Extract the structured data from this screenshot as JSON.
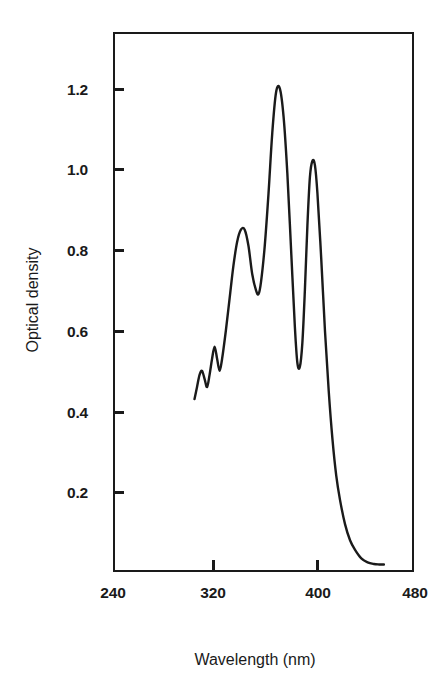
{
  "chart_data": {
    "type": "line",
    "title": "",
    "xlabel": "Wavelength (nm)",
    "ylabel": "Optical density",
    "xlim": [
      240,
      480
    ],
    "ylim": [
      0,
      1.34
    ],
    "grid": false,
    "legend": null,
    "xticks": [
      240,
      320,
      400,
      480
    ],
    "xtick_labels": [
      "240",
      "320",
      "400",
      "480"
    ],
    "yticks": [
      0.2,
      0.4,
      0.6,
      0.8,
      1.0,
      1.2
    ],
    "ytick_labels": [
      "0.2",
      "0.4",
      "0.6",
      "0.8",
      "1.0",
      "1.2"
    ],
    "line_color": "#1a1a1a",
    "line_width": 2.4,
    "series": [
      {
        "name": "absorption spectrum",
        "x": [
          305,
          307,
          309,
          311,
          313,
          315,
          317,
          319,
          321,
          323,
          325,
          327,
          330,
          333,
          336,
          339,
          342,
          345,
          348,
          351,
          354,
          356,
          358,
          361,
          364,
          367,
          370,
          373,
          376,
          379,
          382,
          385,
          387,
          389,
          391,
          393,
          395,
          397,
          399,
          401,
          403,
          406,
          409,
          412,
          415,
          418,
          421,
          425,
          429,
          433,
          438,
          443,
          448,
          452,
          456
        ],
        "y": [
          0.43,
          0.46,
          0.49,
          0.5,
          0.48,
          0.46,
          0.49,
          0.53,
          0.56,
          0.53,
          0.5,
          0.53,
          0.6,
          0.68,
          0.76,
          0.82,
          0.85,
          0.85,
          0.81,
          0.74,
          0.7,
          0.69,
          0.72,
          0.81,
          0.94,
          1.09,
          1.19,
          1.2,
          1.13,
          0.99,
          0.8,
          0.61,
          0.52,
          0.51,
          0.57,
          0.7,
          0.86,
          0.98,
          1.02,
          1.01,
          0.94,
          0.78,
          0.6,
          0.45,
          0.33,
          0.24,
          0.18,
          0.12,
          0.08,
          0.056,
          0.035,
          0.025,
          0.021,
          0.02,
          0.02
        ]
      }
    ],
    "annotations": [
      {
        "label": "shoulder peak",
        "x": 345,
        "y": 0.85
      },
      {
        "label": "local minimum",
        "x": 356,
        "y": 0.69
      },
      {
        "label": "main peak",
        "x": 371,
        "y": 1.2
      },
      {
        "label": "deep minimum",
        "x": 388,
        "y": 0.51
      },
      {
        "label": "secondary peak",
        "x": 399,
        "y": 1.02
      }
    ]
  },
  "axes": {
    "y_title": "Optical density",
    "x_title": "Wavelength (nm)"
  }
}
